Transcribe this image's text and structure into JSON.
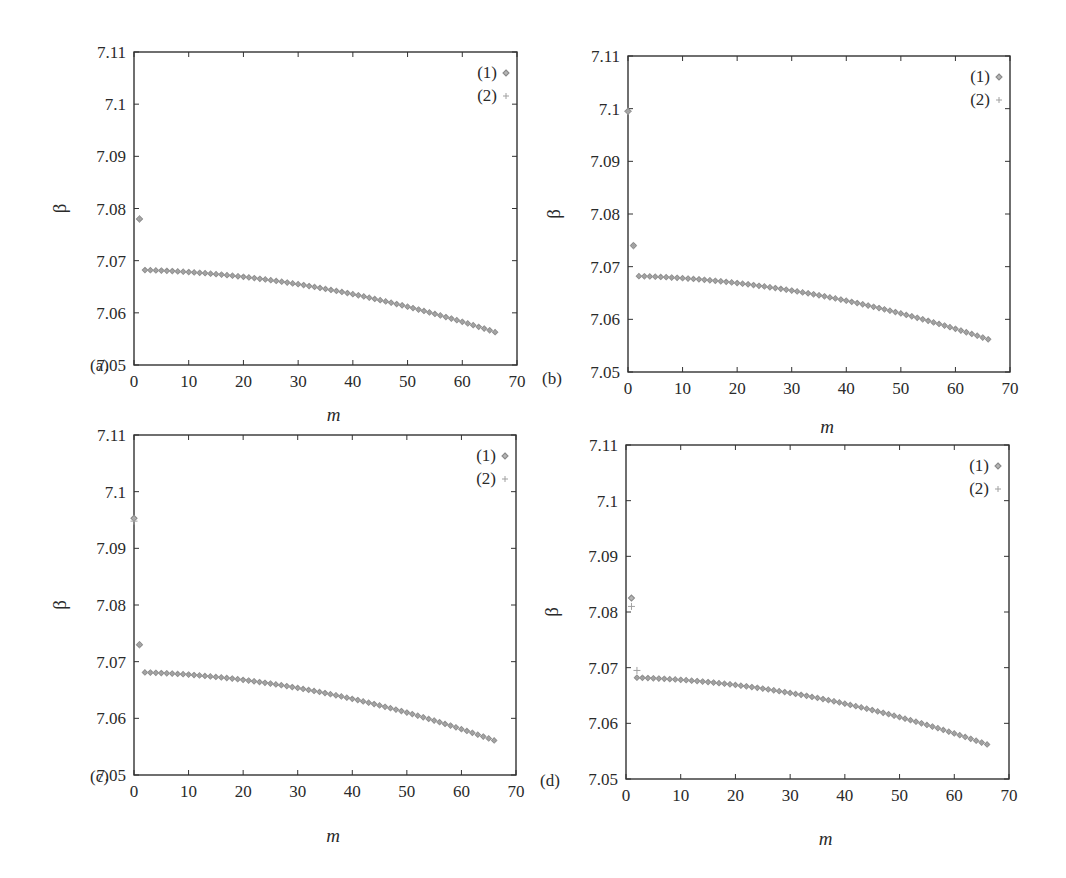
{
  "figure": {
    "panel_labels": [
      "(a)",
      "(b)",
      "(c)",
      "(d)"
    ],
    "xlabel": "m",
    "ylabel": "β",
    "legend": [
      "(1)",
      "(2)"
    ],
    "colors": {
      "frame": "#333333",
      "text": "#2a2a2a",
      "marker": "#8a8a8a",
      "marker_fill": "#b5b5b5"
    }
  },
  "chart_data": [
    {
      "panel": "(a)",
      "type": "scatter",
      "title": "",
      "xlabel": "m",
      "ylabel": "β",
      "xlim": [
        0,
        70
      ],
      "ylim": [
        7.05,
        7.11
      ],
      "xticks": [
        "0",
        "10",
        "20",
        "30",
        "40",
        "50",
        "60",
        "70"
      ],
      "yticks": [
        "7.05",
        "7.06",
        "7.07",
        "7.08",
        "7.09",
        "7.1",
        "7.11"
      ],
      "grid": false,
      "legend_position": "upper right",
      "series": [
        {
          "name": "(1)",
          "marker": "diamond",
          "outliers": [
            {
              "x": 1,
              "y": 7.078
            }
          ],
          "curve": {
            "x_start": 2,
            "x_end": 66,
            "y_start": 7.0682,
            "y_end": 7.0563,
            "shape": "quadratic-decay"
          }
        },
        {
          "name": "(2)",
          "marker": "plus",
          "outliers": [
            {
              "x": 1,
              "y": 7.078
            }
          ],
          "curve": {
            "x_start": 2,
            "x_end": 66,
            "y_start": 7.0682,
            "y_end": 7.0563,
            "shape": "quadratic-decay"
          }
        }
      ],
      "sample_values": {
        "m": [
          2,
          10,
          20,
          30,
          40,
          50,
          60,
          66
        ],
        "beta": [
          7.0682,
          7.068,
          7.0672,
          7.0659,
          7.0641,
          7.0618,
          7.0589,
          7.0563
        ]
      }
    },
    {
      "panel": "(b)",
      "type": "scatter",
      "title": "",
      "xlabel": "m",
      "ylabel": "β",
      "xlim": [
        0,
        70
      ],
      "ylim": [
        7.05,
        7.11
      ],
      "xticks": [
        "0",
        "10",
        "20",
        "30",
        "40",
        "50",
        "60",
        "70"
      ],
      "yticks": [
        "7.05",
        "7.06",
        "7.07",
        "7.08",
        "7.09",
        "7.1",
        "7.11"
      ],
      "grid": false,
      "legend_position": "upper right",
      "series": [
        {
          "name": "(1)",
          "marker": "diamond",
          "outliers": [
            {
              "x": 0,
              "y": 7.0995
            },
            {
              "x": 1,
              "y": 7.074
            }
          ],
          "curve": {
            "x_start": 2,
            "x_end": 66,
            "y_start": 7.0682,
            "y_end": 7.0562,
            "shape": "quadratic-decay"
          }
        },
        {
          "name": "(2)",
          "marker": "plus",
          "outliers": [
            {
              "x": 0,
              "y": 7.0995
            },
            {
              "x": 1,
              "y": 7.074
            }
          ],
          "curve": {
            "x_start": 2,
            "x_end": 66,
            "y_start": 7.0682,
            "y_end": 7.0562,
            "shape": "quadratic-decay"
          }
        }
      ],
      "sample_values": {
        "m": [
          0,
          1,
          2,
          10,
          20,
          30,
          40,
          50,
          60,
          66
        ],
        "beta": [
          7.0995,
          7.074,
          7.0682,
          7.068,
          7.0672,
          7.0659,
          7.0641,
          7.0617,
          7.0588,
          7.0562
        ]
      }
    },
    {
      "panel": "(c)",
      "type": "scatter",
      "title": "",
      "xlabel": "m",
      "ylabel": "β",
      "xlim": [
        0,
        70
      ],
      "ylim": [
        7.05,
        7.11
      ],
      "xticks": [
        "0",
        "10",
        "20",
        "30",
        "40",
        "50",
        "60",
        "70"
      ],
      "yticks": [
        "7.05",
        "7.06",
        "7.07",
        "7.08",
        "7.09",
        "7.1",
        "7.11"
      ],
      "grid": false,
      "legend_position": "upper right",
      "series": [
        {
          "name": "(1)",
          "marker": "diamond",
          "outliers": [
            {
              "x": 0,
              "y": 7.0953
            },
            {
              "x": 1,
              "y": 7.073
            }
          ],
          "curve": {
            "x_start": 2,
            "x_end": 66,
            "y_start": 7.0681,
            "y_end": 7.0561,
            "shape": "quadratic-decay"
          }
        },
        {
          "name": "(2)",
          "marker": "plus",
          "outliers": [
            {
              "x": 0,
              "y": 7.0948
            },
            {
              "x": 1,
              "y": 7.073
            }
          ],
          "curve": {
            "x_start": 2,
            "x_end": 66,
            "y_start": 7.0681,
            "y_end": 7.0561,
            "shape": "quadratic-decay"
          }
        }
      ],
      "sample_values": {
        "m": [
          0,
          1,
          2,
          10,
          20,
          30,
          40,
          50,
          60,
          66
        ],
        "beta": [
          7.0953,
          7.073,
          7.0681,
          7.0679,
          7.0671,
          7.0658,
          7.064,
          7.0616,
          7.0587,
          7.0561
        ]
      }
    },
    {
      "panel": "(d)",
      "type": "scatter",
      "title": "",
      "xlabel": "m",
      "ylabel": "β",
      "xlim": [
        0,
        70
      ],
      "ylim": [
        7.05,
        7.11
      ],
      "xticks": [
        "0",
        "10",
        "20",
        "30",
        "40",
        "50",
        "60",
        "70"
      ],
      "yticks": [
        "7.05",
        "7.06",
        "7.07",
        "7.08",
        "7.09",
        "7.1",
        "7.11"
      ],
      "grid": false,
      "legend_position": "upper right",
      "series": [
        {
          "name": "(1)",
          "marker": "diamond",
          "outliers": [
            {
              "x": 1,
              "y": 7.0825
            }
          ],
          "curve": {
            "x_start": 2,
            "x_end": 66,
            "y_start": 7.0682,
            "y_end": 7.0562,
            "shape": "quadratic-decay"
          }
        },
        {
          "name": "(2)",
          "marker": "plus",
          "outliers": [
            {
              "x": 1,
              "y": 7.081
            },
            {
              "x": 2,
              "y": 7.0695
            }
          ],
          "curve": {
            "x_start": 2,
            "x_end": 66,
            "y_start": 7.0682,
            "y_end": 7.0562,
            "shape": "quadratic-decay"
          }
        }
      ],
      "sample_values": {
        "m": [
          1,
          2,
          10,
          20,
          30,
          40,
          50,
          60,
          66
        ],
        "beta": [
          7.0825,
          7.0682,
          7.068,
          7.0672,
          7.0659,
          7.0641,
          7.0617,
          7.0588,
          7.0562
        ]
      }
    }
  ],
  "layout": {
    "panels": [
      {
        "left": 134,
        "top": 52,
        "right": 517,
        "bottom": 365,
        "label_x": 90,
        "label_y": 371,
        "ylabel_x": 66,
        "xlabel_y": 421
      },
      {
        "left": 628,
        "top": 56,
        "right": 1010,
        "bottom": 372,
        "label_x": 542,
        "label_y": 384,
        "ylabel_x": 560,
        "xlabel_y": 433
      },
      {
        "left": 134,
        "top": 435,
        "right": 516,
        "bottom": 775,
        "label_x": 90,
        "label_y": 782,
        "ylabel_x": 66,
        "xlabel_y": 842
      },
      {
        "left": 626,
        "top": 445,
        "right": 1009,
        "bottom": 779,
        "label_x": 540,
        "label_y": 786,
        "ylabel_x": 558,
        "xlabel_y": 845
      }
    ]
  }
}
